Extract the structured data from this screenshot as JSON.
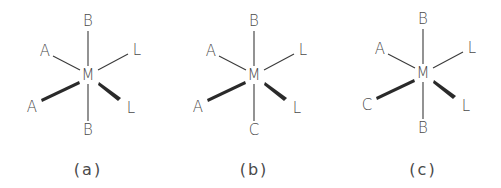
{
  "figure": {
    "structures": [
      {
        "id": "a",
        "caption": "(a)",
        "center": "M",
        "ligands": {
          "top": "B",
          "upper_left": "A",
          "upper_right": "L",
          "lower_left_wedge": "A",
          "lower_right_wedge": "L",
          "bottom": "B"
        }
      },
      {
        "id": "b",
        "caption": "(b)",
        "center": "M",
        "ligands": {
          "top": "B",
          "upper_left": "A",
          "upper_right": "L",
          "lower_left_wedge": "A",
          "lower_right_wedge": "L",
          "bottom": "C"
        }
      },
      {
        "id": "c",
        "caption": "(c)",
        "center": "M",
        "ligands": {
          "top": "B",
          "upper_left": "A",
          "upper_right": "L",
          "lower_left_wedge": "C",
          "lower_right_wedge": "L",
          "bottom": "B"
        }
      }
    ]
  }
}
